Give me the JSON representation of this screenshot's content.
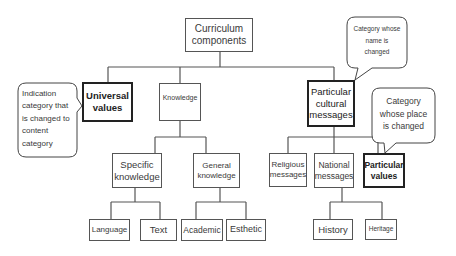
{
  "diagram": {
    "type": "tree",
    "root": {
      "id": "curriculum",
      "label": "Curriculum components"
    },
    "nodes": [
      {
        "id": "universal",
        "label": "Universal values",
        "parent": "curriculum",
        "highlighted": true
      },
      {
        "id": "knowledge",
        "label": "Knowledge",
        "parent": "curriculum",
        "highlighted": false
      },
      {
        "id": "particular_cultural",
        "label": "Particular cultural messages",
        "parent": "curriculum",
        "highlighted": true
      },
      {
        "id": "specific",
        "label": "Specific knowledge",
        "parent": "knowledge",
        "highlighted": false
      },
      {
        "id": "general",
        "label": "General knowledge",
        "parent": "knowledge",
        "highlighted": false
      },
      {
        "id": "religious",
        "label": "Religious messages",
        "parent": "particular_cultural",
        "highlighted": false
      },
      {
        "id": "national",
        "label": "National messages",
        "parent": "particular_cultural",
        "highlighted": false
      },
      {
        "id": "particular_values",
        "label": "Particular values",
        "parent": "particular_cultural",
        "highlighted": true
      },
      {
        "id": "language",
        "label": "Language",
        "parent": "specific",
        "highlighted": false
      },
      {
        "id": "text",
        "label": "Text",
        "parent": "specific",
        "highlighted": false
      },
      {
        "id": "academic",
        "label": "Academic",
        "parent": "general",
        "highlighted": false
      },
      {
        "id": "esthetic",
        "label": "Esthetic",
        "parent": "general",
        "highlighted": false
      },
      {
        "id": "history",
        "label": "History",
        "parent": "national",
        "highlighted": false
      },
      {
        "id": "heritage",
        "label": "Heritage",
        "parent": "national",
        "highlighted": false
      }
    ],
    "callouts": [
      {
        "id": "callout_universal",
        "text": "Indication category that is changed to content category",
        "points_to": "universal"
      },
      {
        "id": "callout_name",
        "text": "Category whose name is changed",
        "points_to": "particular_cultural"
      },
      {
        "id": "callout_place",
        "text": "Category whose place is changed",
        "points_to": "particular_values"
      }
    ]
  },
  "labels": {
    "curriculum_l1": "Curriculum",
    "curriculum_l2": "components",
    "universal_l1": "Universal",
    "universal_l2": "values",
    "knowledge": "Knowledge",
    "pcm_l1": "Particular",
    "pcm_l2": "cultural",
    "pcm_l3": "messages",
    "specific_l1": "Specific",
    "specific_l2": "knowledge",
    "general_l1": "General",
    "general_l2": "knowledge",
    "religious_l1": "Religious",
    "religious_l2": "messages",
    "national_l1": "National",
    "national_l2": "messages",
    "pv_l1": "Particular",
    "pv_l2": "values",
    "language": "Language",
    "text": "Text",
    "academic": "Academic",
    "esthetic": "Esthetic",
    "history": "History",
    "heritage": "Heritage",
    "callout_left_l1": "Indication",
    "callout_left_l2": "category that",
    "callout_left_l3": "is changed to",
    "callout_left_l4": "content",
    "callout_left_l5": "category",
    "callout_name_l1": "Category whose",
    "callout_name_l2": "name is",
    "callout_name_l3": "changed",
    "callout_place_l1": "Category",
    "callout_place_l2": "whose place",
    "callout_place_l3": "is changed"
  },
  "colors": {
    "line": "#555555",
    "bold_border": "#222222",
    "text": "#3a3a3a",
    "background": "#ffffff"
  }
}
